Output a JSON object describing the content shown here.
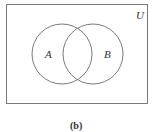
{
  "diagram": {
    "type": "venn",
    "universe_label": "U",
    "sets": [
      {
        "label": "A"
      },
      {
        "label": "B"
      }
    ],
    "caption": "(b)",
    "colors": {
      "stroke": "#7a7a7a",
      "text": "#333333",
      "background": "#ffffff"
    }
  }
}
